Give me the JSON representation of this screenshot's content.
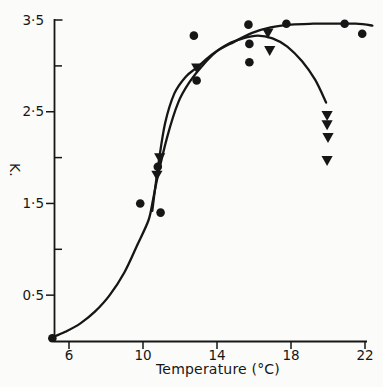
{
  "figure": {
    "background": "#fbfbf9",
    "ink": "#161616"
  },
  "chart_data": {
    "type": "scatter",
    "title": "",
    "xlabel": "Temperature (°C)",
    "ylabel": "K.",
    "grid": false,
    "legend": "none",
    "xlim": [
      4.9,
      22.6
    ],
    "ylim": [
      0,
      3.55
    ],
    "x_ticks": [
      {
        "value": 6,
        "label": "6"
      },
      {
        "value": 10,
        "label": "10"
      },
      {
        "value": 14,
        "label": "14"
      },
      {
        "value": 18,
        "label": "18"
      },
      {
        "value": 22,
        "label": "22"
      }
    ],
    "y_ticks": [
      {
        "value": 0.5,
        "label": "0·5"
      },
      {
        "value": 1.5,
        "label": "1·5"
      },
      {
        "value": 2.5,
        "label": "2·5"
      },
      {
        "value": 3.5,
        "label": "3·5"
      }
    ],
    "y_minor_ticks": [
      1.0,
      2.0,
      3.0
    ],
    "series": [
      {
        "name": "circle-markers",
        "marker": "circle",
        "points": [
          [
            5.1,
            0.03
          ],
          [
            9.85,
            1.5
          ],
          [
            10.95,
            1.4
          ],
          [
            10.8,
            1.9
          ],
          [
            12.9,
            2.84
          ],
          [
            12.75,
            3.33
          ],
          [
            15.7,
            3.45
          ],
          [
            15.75,
            3.24
          ],
          [
            15.75,
            3.04
          ],
          [
            17.75,
            3.46
          ],
          [
            20.9,
            3.46
          ],
          [
            21.85,
            3.35
          ]
        ]
      },
      {
        "name": "triangle-markers",
        "marker": "triangle-down",
        "points": [
          [
            10.9,
            2.0
          ],
          [
            10.75,
            1.81
          ],
          [
            12.9,
            2.98
          ],
          [
            16.75,
            3.36
          ],
          [
            16.85,
            3.17
          ],
          [
            19.95,
            2.46
          ],
          [
            19.95,
            2.36
          ],
          [
            20.0,
            2.22
          ],
          [
            19.95,
            1.97
          ]
        ]
      }
    ],
    "fit_curves": [
      {
        "name": "sigmoid-plateau-fit-circles",
        "points": [
          [
            5.1,
            0.04
          ],
          [
            5.8,
            0.1
          ],
          [
            6.6,
            0.19
          ],
          [
            7.4,
            0.32
          ],
          [
            8.2,
            0.5
          ],
          [
            9.0,
            0.75
          ],
          [
            9.7,
            1.05
          ],
          [
            10.3,
            1.32
          ],
          [
            10.55,
            1.55
          ],
          [
            10.8,
            1.8
          ],
          [
            11.3,
            2.22
          ],
          [
            11.9,
            2.6
          ],
          [
            12.5,
            2.82
          ],
          [
            13.2,
            3.0
          ],
          [
            14.0,
            3.16
          ],
          [
            14.9,
            3.26
          ],
          [
            15.9,
            3.36
          ],
          [
            16.9,
            3.42
          ],
          [
            18.0,
            3.45
          ],
          [
            19.2,
            3.46
          ],
          [
            20.5,
            3.46
          ],
          [
            21.5,
            3.46
          ],
          [
            22.4,
            3.44
          ]
        ]
      },
      {
        "name": "rise-fall-fit-triangles",
        "points": [
          [
            10.5,
            1.42
          ],
          [
            10.85,
            1.95
          ],
          [
            11.2,
            2.38
          ],
          [
            11.7,
            2.7
          ],
          [
            12.3,
            2.88
          ],
          [
            12.9,
            2.98
          ],
          [
            13.7,
            3.12
          ],
          [
            14.6,
            3.24
          ],
          [
            15.4,
            3.3
          ],
          [
            16.2,
            3.33
          ],
          [
            17.0,
            3.3
          ],
          [
            17.8,
            3.21
          ],
          [
            18.6,
            3.05
          ],
          [
            19.3,
            2.85
          ],
          [
            19.9,
            2.6
          ]
        ]
      }
    ]
  }
}
